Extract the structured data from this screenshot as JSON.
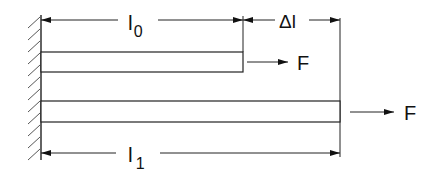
{
  "diagram": {
    "title": "",
    "labels": {
      "original_length": "l",
      "original_length_sub": "0",
      "extension": "Δl",
      "final_length": "l",
      "final_length_sub": "1",
      "force_top": "F",
      "force_bottom": "F"
    },
    "elements": [
      {
        "name": "fixed-wall",
        "type": "hatched-support"
      },
      {
        "name": "rod-unstretched",
        "type": "bar",
        "length_label": "l0"
      },
      {
        "name": "rod-stretched",
        "type": "bar",
        "length_label": "l1"
      },
      {
        "name": "force-arrow-top",
        "label": "F"
      },
      {
        "name": "force-arrow-bottom",
        "label": "F"
      }
    ],
    "colors": {
      "line": "#222222",
      "background": "#ffffff"
    }
  }
}
